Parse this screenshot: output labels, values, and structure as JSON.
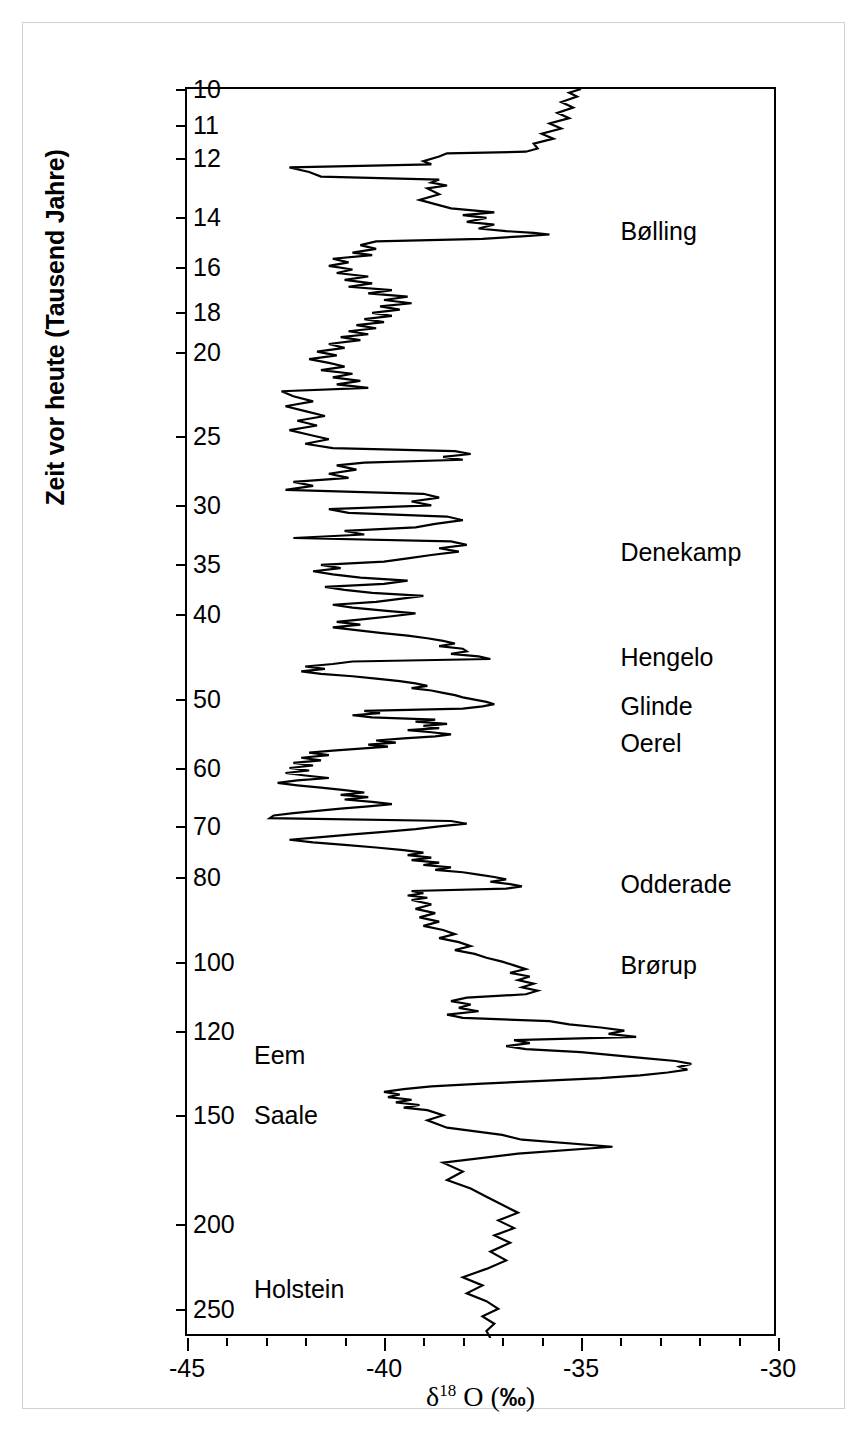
{
  "chart_data": {
    "type": "line",
    "title": "",
    "xlabel": "δ18 O (‰)",
    "ylabel": "Zeit vor heute (Tausend Jahre)",
    "xlim": [
      -45,
      -30
    ],
    "ylim": [
      10,
      270
    ],
    "y_scale": "log",
    "y_inverted": true,
    "grid": false,
    "legend": "none",
    "x_major_ticks": [
      -45,
      -40,
      -35,
      -30
    ],
    "x_major_tick_labels": [
      "-45",
      "-40",
      "-35",
      "-30"
    ],
    "x_minor_tick_step": 1,
    "y_ticks": [
      10,
      11,
      12,
      14,
      16,
      18,
      20,
      25,
      30,
      35,
      40,
      50,
      60,
      70,
      80,
      100,
      120,
      150,
      200,
      250
    ],
    "y_tick_labels": [
      "10",
      "11",
      "12",
      "14",
      "16",
      "18",
      "20",
      "25",
      "30",
      "35",
      "40",
      "50",
      "60",
      "70",
      "80",
      "100",
      "120",
      "150",
      "200",
      "250"
    ],
    "series_name": "delta-18-O",
    "series_units": "per mil",
    "x_variable": "delta18O",
    "y_variable": "age_ka_BP",
    "points": [
      [
        10.0,
        -35.0
      ],
      [
        10.1,
        -35.3
      ],
      [
        10.2,
        -35.1
      ],
      [
        10.35,
        -35.5
      ],
      [
        10.5,
        -35.2
      ],
      [
        10.65,
        -35.6
      ],
      [
        10.8,
        -35.3
      ],
      [
        10.95,
        -35.8
      ],
      [
        11.1,
        -35.5
      ],
      [
        11.25,
        -36.0
      ],
      [
        11.4,
        -35.7
      ],
      [
        11.55,
        -36.2
      ],
      [
        11.7,
        -36.1
      ],
      [
        11.8,
        -36.4
      ],
      [
        11.85,
        -38.4
      ],
      [
        11.95,
        -38.6
      ],
      [
        12.1,
        -39.0
      ],
      [
        12.2,
        -38.8
      ],
      [
        12.3,
        -42.4
      ],
      [
        12.45,
        -41.9
      ],
      [
        12.6,
        -41.6
      ],
      [
        12.7,
        -38.6
      ],
      [
        12.8,
        -38.8
      ],
      [
        12.9,
        -38.4
      ],
      [
        13.0,
        -38.9
      ],
      [
        13.2,
        -38.6
      ],
      [
        13.4,
        -39.1
      ],
      [
        13.55,
        -38.7
      ],
      [
        13.7,
        -38.3
      ],
      [
        13.85,
        -37.2
      ],
      [
        13.95,
        -38.0
      ],
      [
        14.05,
        -37.4
      ],
      [
        14.2,
        -37.9
      ],
      [
        14.3,
        -37.2
      ],
      [
        14.45,
        -37.6
      ],
      [
        14.55,
        -36.9
      ],
      [
        14.62,
        -36.2
      ],
      [
        14.68,
        -35.8
      ],
      [
        14.75,
        -36.5
      ],
      [
        14.85,
        -37.5
      ],
      [
        14.95,
        -40.2
      ],
      [
        15.1,
        -40.6
      ],
      [
        15.25,
        -40.2
      ],
      [
        15.4,
        -40.8
      ],
      [
        15.5,
        -40.3
      ],
      [
        15.65,
        -41.3
      ],
      [
        15.8,
        -40.9
      ],
      [
        15.95,
        -41.4
      ],
      [
        16.1,
        -40.8
      ],
      [
        16.25,
        -41.2
      ],
      [
        16.4,
        -40.4
      ],
      [
        16.55,
        -41.0
      ],
      [
        16.7,
        -40.3
      ],
      [
        16.85,
        -40.9
      ],
      [
        17.0,
        -39.8
      ],
      [
        17.15,
        -40.4
      ],
      [
        17.3,
        -39.4
      ],
      [
        17.45,
        -40.0
      ],
      [
        17.6,
        -39.3
      ],
      [
        17.75,
        -40.1
      ],
      [
        17.9,
        -39.6
      ],
      [
        18.05,
        -40.3
      ],
      [
        18.2,
        -39.8
      ],
      [
        18.35,
        -40.5
      ],
      [
        18.5,
        -40.0
      ],
      [
        18.65,
        -40.7
      ],
      [
        18.8,
        -40.2
      ],
      [
        18.95,
        -40.9
      ],
      [
        19.1,
        -40.4
      ],
      [
        19.25,
        -41.1
      ],
      [
        19.4,
        -40.6
      ],
      [
        19.6,
        -41.4
      ],
      [
        19.8,
        -41.0
      ],
      [
        20.0,
        -41.7
      ],
      [
        20.2,
        -41.2
      ],
      [
        20.4,
        -41.9
      ],
      [
        20.6,
        -41.4
      ],
      [
        20.8,
        -41.0
      ],
      [
        21.0,
        -41.6
      ],
      [
        21.2,
        -40.8
      ],
      [
        21.4,
        -41.3
      ],
      [
        21.6,
        -40.6
      ],
      [
        21.8,
        -41.2
      ],
      [
        22.0,
        -40.4
      ],
      [
        22.2,
        -42.6
      ],
      [
        22.5,
        -42.3
      ],
      [
        22.8,
        -41.8
      ],
      [
        23.1,
        -42.5
      ],
      [
        23.4,
        -42.0
      ],
      [
        23.7,
        -41.5
      ],
      [
        24.0,
        -42.2
      ],
      [
        24.3,
        -41.7
      ],
      [
        24.6,
        -42.4
      ],
      [
        24.9,
        -41.9
      ],
      [
        25.2,
        -41.4
      ],
      [
        25.5,
        -42.0
      ],
      [
        25.8,
        -41.3
      ],
      [
        26.0,
        -38.2
      ],
      [
        26.2,
        -37.8
      ],
      [
        26.4,
        -38.5
      ],
      [
        26.6,
        -38.0
      ],
      [
        26.8,
        -40.5
      ],
      [
        27.0,
        -41.2
      ],
      [
        27.3,
        -40.7
      ],
      [
        27.6,
        -41.4
      ],
      [
        27.9,
        -40.9
      ],
      [
        28.2,
        -42.3
      ],
      [
        28.5,
        -41.8
      ],
      [
        28.8,
        -42.5
      ],
      [
        29.1,
        -39.0
      ],
      [
        29.4,
        -38.6
      ],
      [
        29.7,
        -39.3
      ],
      [
        30.0,
        -38.8
      ],
      [
        30.3,
        -41.4
      ],
      [
        30.6,
        -40.9
      ],
      [
        30.9,
        -38.4
      ],
      [
        31.2,
        -38.0
      ],
      [
        31.5,
        -38.7
      ],
      [
        31.8,
        -39.2
      ],
      [
        32.1,
        -41.0
      ],
      [
        32.4,
        -40.5
      ],
      [
        32.7,
        -42.3
      ],
      [
        33.0,
        -38.3
      ],
      [
        33.3,
        -37.9
      ],
      [
        33.6,
        -38.6
      ],
      [
        33.9,
        -38.1
      ],
      [
        34.2,
        -38.8
      ],
      [
        34.5,
        -39.4
      ],
      [
        34.8,
        -40.0
      ],
      [
        35.1,
        -41.6
      ],
      [
        35.4,
        -41.1
      ],
      [
        35.7,
        -41.8
      ],
      [
        36.0,
        -41.3
      ],
      [
        36.3,
        -40.6
      ],
      [
        36.6,
        -39.4
      ],
      [
        36.9,
        -40.0
      ],
      [
        37.2,
        -41.5
      ],
      [
        37.5,
        -41.0
      ],
      [
        37.8,
        -40.3
      ],
      [
        38.1,
        -39.0
      ],
      [
        38.4,
        -39.6
      ],
      [
        38.7,
        -40.2
      ],
      [
        39.0,
        -41.3
      ],
      [
        39.3,
        -40.8
      ],
      [
        39.6,
        -40.0
      ],
      [
        39.9,
        -39.2
      ],
      [
        40.2,
        -39.8
      ],
      [
        40.5,
        -40.5
      ],
      [
        40.8,
        -41.2
      ],
      [
        41.1,
        -40.6
      ],
      [
        41.4,
        -41.3
      ],
      [
        41.7,
        -40.7
      ],
      [
        42.0,
        -40.1
      ],
      [
        42.3,
        -39.4
      ],
      [
        42.6,
        -38.9
      ],
      [
        42.9,
        -38.5
      ],
      [
        43.2,
        -38.2
      ],
      [
        43.5,
        -38.6
      ],
      [
        43.8,
        -38.0
      ],
      [
        44.1,
        -37.9
      ],
      [
        44.4,
        -38.3
      ],
      [
        44.7,
        -37.6
      ],
      [
        45.0,
        -37.3
      ],
      [
        45.3,
        -40.8
      ],
      [
        45.6,
        -41.3
      ],
      [
        45.9,
        -42.0
      ],
      [
        46.2,
        -41.5
      ],
      [
        46.5,
        -42.1
      ],
      [
        46.8,
        -41.6
      ],
      [
        47.1,
        -40.8
      ],
      [
        47.4,
        -40.2
      ],
      [
        47.7,
        -39.6
      ],
      [
        48.0,
        -39.2
      ],
      [
        48.3,
        -38.9
      ],
      [
        48.6,
        -39.3
      ],
      [
        48.9,
        -38.8
      ],
      [
        49.2,
        -38.5
      ],
      [
        49.5,
        -38.2
      ],
      [
        49.8,
        -38.0
      ],
      [
        50.1,
        -37.7
      ],
      [
        50.4,
        -37.4
      ],
      [
        50.7,
        -37.2
      ],
      [
        51.0,
        -37.5
      ],
      [
        51.3,
        -38.0
      ],
      [
        51.6,
        -40.5
      ],
      [
        51.9,
        -40.1
      ],
      [
        52.2,
        -40.8
      ],
      [
        52.5,
        -40.3
      ],
      [
        52.8,
        -38.7
      ],
      [
        53.1,
        -39.2
      ],
      [
        53.4,
        -38.4
      ],
      [
        53.7,
        -39.0
      ],
      [
        54.0,
        -38.6
      ],
      [
        54.3,
        -39.4
      ],
      [
        54.6,
        -38.8
      ],
      [
        54.9,
        -38.3
      ],
      [
        55.2,
        -38.7
      ],
      [
        55.5,
        -39.5
      ],
      [
        55.8,
        -40.2
      ],
      [
        56.1,
        -39.7
      ],
      [
        56.4,
        -40.4
      ],
      [
        56.7,
        -39.9
      ],
      [
        57.0,
        -40.6
      ],
      [
        57.3,
        -41.3
      ],
      [
        57.6,
        -41.9
      ],
      [
        58.0,
        -41.4
      ],
      [
        58.4,
        -42.1
      ],
      [
        58.8,
        -41.6
      ],
      [
        59.2,
        -42.3
      ],
      [
        59.6,
        -41.8
      ],
      [
        60.0,
        -42.4
      ],
      [
        60.4,
        -41.9
      ],
      [
        60.8,
        -42.5
      ],
      [
        61.2,
        -42.0
      ],
      [
        61.6,
        -41.4
      ],
      [
        62.0,
        -42.2
      ],
      [
        62.4,
        -42.7
      ],
      [
        62.8,
        -42.2
      ],
      [
        63.2,
        -41.6
      ],
      [
        63.6,
        -41.0
      ],
      [
        64.0,
        -40.5
      ],
      [
        64.4,
        -41.1
      ],
      [
        64.8,
        -40.4
      ],
      [
        65.2,
        -41.0
      ],
      [
        65.6,
        -40.3
      ],
      [
        66.0,
        -39.8
      ],
      [
        66.4,
        -40.4
      ],
      [
        66.8,
        -41.1
      ],
      [
        67.2,
        -41.7
      ],
      [
        67.6,
        -42.3
      ],
      [
        68.0,
        -42.8
      ],
      [
        68.5,
        -42.9
      ],
      [
        69.0,
        -38.3
      ],
      [
        69.5,
        -37.9
      ],
      [
        70.0,
        -38.6
      ],
      [
        70.5,
        -39.2
      ],
      [
        71.0,
        -40.0
      ],
      [
        71.5,
        -40.8
      ],
      [
        72.0,
        -41.6
      ],
      [
        72.5,
        -42.4
      ],
      [
        73.0,
        -41.8
      ],
      [
        73.5,
        -41.0
      ],
      [
        74.0,
        -40.2
      ],
      [
        74.5,
        -39.5
      ],
      [
        75.0,
        -39.0
      ],
      [
        75.5,
        -39.4
      ],
      [
        76.0,
        -38.8
      ],
      [
        76.5,
        -39.3
      ],
      [
        77.0,
        -38.6
      ],
      [
        77.5,
        -39.0
      ],
      [
        78.0,
        -38.3
      ],
      [
        78.5,
        -38.7
      ],
      [
        79.0,
        -38.0
      ],
      [
        79.5,
        -37.6
      ],
      [
        80.0,
        -37.2
      ],
      [
        80.5,
        -36.9
      ],
      [
        81.0,
        -37.3
      ],
      [
        81.5,
        -36.8
      ],
      [
        82.0,
        -36.5
      ],
      [
        82.5,
        -36.9
      ],
      [
        83.0,
        -39.3
      ],
      [
        83.5,
        -39.0
      ],
      [
        84.0,
        -39.4
      ],
      [
        84.5,
        -38.9
      ],
      [
        85.0,
        -39.3
      ],
      [
        86.0,
        -38.8
      ],
      [
        87.0,
        -39.2
      ],
      [
        88.0,
        -38.7
      ],
      [
        89.0,
        -39.1
      ],
      [
        90.0,
        -38.6
      ],
      [
        91.0,
        -39.0
      ],
      [
        92.0,
        -38.5
      ],
      [
        93.0,
        -38.2
      ],
      [
        94.0,
        -38.6
      ],
      [
        95.0,
        -38.1
      ],
      [
        96.0,
        -37.8
      ],
      [
        97.0,
        -38.2
      ],
      [
        98.0,
        -37.7
      ],
      [
        99.0,
        -37.4
      ],
      [
        100.0,
        -37.0
      ],
      [
        101.0,
        -36.7
      ],
      [
        102.0,
        -36.4
      ],
      [
        103.0,
        -36.8
      ],
      [
        104.0,
        -36.3
      ],
      [
        105.0,
        -36.6
      ],
      [
        106.0,
        -36.2
      ],
      [
        107.0,
        -36.5
      ],
      [
        108.0,
        -36.1
      ],
      [
        109.0,
        -36.4
      ],
      [
        110.0,
        -37.9
      ],
      [
        111.0,
        -38.3
      ],
      [
        112.0,
        -37.8
      ],
      [
        113.0,
        -38.1
      ],
      [
        114.0,
        -37.6
      ],
      [
        115.0,
        -38.4
      ],
      [
        116.0,
        -38.0
      ],
      [
        117.0,
        -35.8
      ],
      [
        118.0,
        -35.3
      ],
      [
        119.0,
        -34.5
      ],
      [
        120.0,
        -33.9
      ],
      [
        121.0,
        -34.3
      ],
      [
        122.0,
        -33.6
      ],
      [
        123.0,
        -36.7
      ],
      [
        124.0,
        -36.3
      ],
      [
        125.0,
        -36.9
      ],
      [
        126.0,
        -36.4
      ],
      [
        127.0,
        -35.0
      ],
      [
        128.0,
        -34.2
      ],
      [
        129.0,
        -33.4
      ],
      [
        130.0,
        -32.6
      ],
      [
        131.0,
        -32.2
      ],
      [
        132.0,
        -32.5
      ],
      [
        133.0,
        -32.3
      ],
      [
        134.0,
        -32.8
      ],
      [
        135.0,
        -33.5
      ],
      [
        136.0,
        -34.5
      ],
      [
        137.0,
        -36.0
      ],
      [
        138.0,
        -37.5
      ],
      [
        139.0,
        -38.8
      ],
      [
        140.0,
        -39.5
      ],
      [
        141.0,
        -40.0
      ],
      [
        142.0,
        -39.6
      ],
      [
        143.0,
        -39.9
      ],
      [
        144.0,
        -39.3
      ],
      [
        145.0,
        -39.7
      ],
      [
        146.0,
        -39.1
      ],
      [
        147.0,
        -39.5
      ],
      [
        148.0,
        -38.9
      ],
      [
        150.0,
        -38.5
      ],
      [
        152.0,
        -38.9
      ],
      [
        155.0,
        -38.4
      ],
      [
        158.0,
        -37.0
      ],
      [
        160.0,
        -36.5
      ],
      [
        163.0,
        -34.2
      ],
      [
        166.0,
        -36.6
      ],
      [
        170.0,
        -38.5
      ],
      [
        174.0,
        -38.0
      ],
      [
        178.0,
        -38.4
      ],
      [
        182.0,
        -37.8
      ],
      [
        186.0,
        -37.4
      ],
      [
        190.0,
        -37.0
      ],
      [
        194.0,
        -36.6
      ],
      [
        198.0,
        -37.1
      ],
      [
        202.0,
        -36.7
      ],
      [
        206.0,
        -37.2
      ],
      [
        210.0,
        -36.8
      ],
      [
        215.0,
        -37.3
      ],
      [
        220.0,
        -36.9
      ],
      [
        225.0,
        -37.4
      ],
      [
        230.0,
        -38.0
      ],
      [
        235.0,
        -37.5
      ],
      [
        240.0,
        -37.9
      ],
      [
        245.0,
        -37.4
      ],
      [
        250.0,
        -37.1
      ],
      [
        255.0,
        -37.5
      ],
      [
        260.0,
        -37.2
      ],
      [
        265.0,
        -37.4
      ],
      [
        270.0,
        -37.3
      ]
    ],
    "annotations": [
      {
        "text": "Bølling",
        "age_ka": 14.55,
        "label_x": -34.0
      },
      {
        "text": "Denekamp",
        "age_ka": 33.9,
        "label_x": -34.0
      },
      {
        "text": "Hengelo",
        "age_ka": 44.8,
        "label_x": -34.0
      },
      {
        "text": "Glinde",
        "age_ka": 51.0,
        "label_x": -34.0
      },
      {
        "text": "Oerel",
        "age_ka": 56.1,
        "label_x": -34.0
      },
      {
        "text": "Odderade",
        "age_ka": 81.5,
        "label_x": -34.0
      },
      {
        "text": "Brørup",
        "age_ka": 101.0,
        "label_x": -34.0
      },
      {
        "text": "Eem",
        "age_ka": 128.0,
        "label_x": -43.3
      },
      {
        "text": "Saale",
        "age_ka": 150.0,
        "label_x": -43.3
      },
      {
        "text": "Holstein",
        "age_ka": 237.0,
        "label_x": -43.3
      }
    ]
  },
  "axes": {
    "y_title": "Zeit vor heute (Tausend Jahre)",
    "x_title_delta": "δ",
    "x_title_sup": "18",
    "x_title_element": " O (",
    "x_title_permille": "‰",
    "x_title_close": ")"
  }
}
